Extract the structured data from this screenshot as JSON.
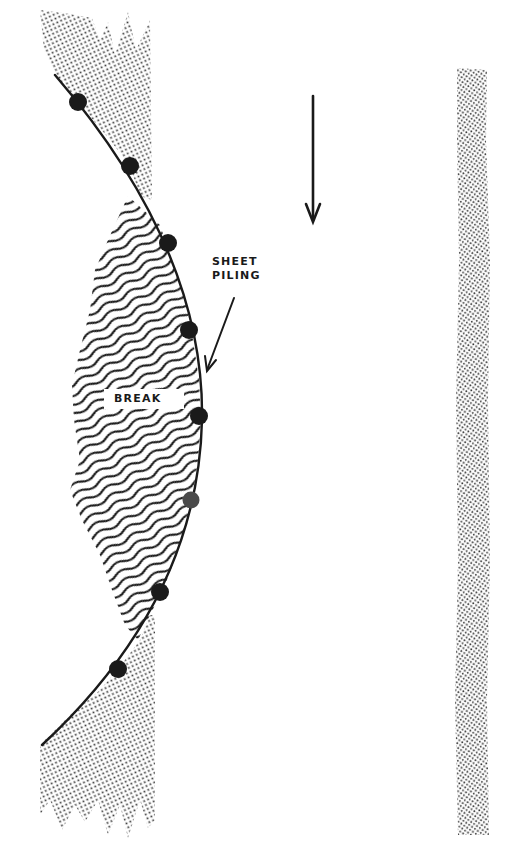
{
  "figure": {
    "type": "technical-illustration",
    "labels": {
      "sheet_piling_line1": "SHEET",
      "sheet_piling_line2": "PILING",
      "break": "BREAK"
    },
    "flow_arrow": {
      "direction": "down",
      "x": 313,
      "y_start": 95,
      "y_end": 222
    },
    "piling_curve": {
      "start": [
        55,
        75
      ],
      "end": [
        42,
        745
      ],
      "piles": [
        {
          "x": 78,
          "y": 102,
          "style": "solid"
        },
        {
          "x": 130,
          "y": 166,
          "style": "solid"
        },
        {
          "x": 168,
          "y": 243,
          "style": "solid"
        },
        {
          "x": 189,
          "y": 330,
          "style": "solid"
        },
        {
          "x": 199,
          "y": 416,
          "style": "solid"
        },
        {
          "x": 191,
          "y": 500,
          "style": "light"
        },
        {
          "x": 160,
          "y": 592,
          "style": "solid"
        },
        {
          "x": 118,
          "y": 669,
          "style": "solid"
        }
      ]
    },
    "regions": {
      "upper_fill": "stippled soil",
      "middle_fill": "wavy hatching (washout)",
      "lower_fill": "stippled soil",
      "right_strip": "stippled bank"
    },
    "colors": {
      "ink": "#1a1a1a",
      "stipple": "#3a3a3a",
      "background": "#ffffff"
    }
  }
}
